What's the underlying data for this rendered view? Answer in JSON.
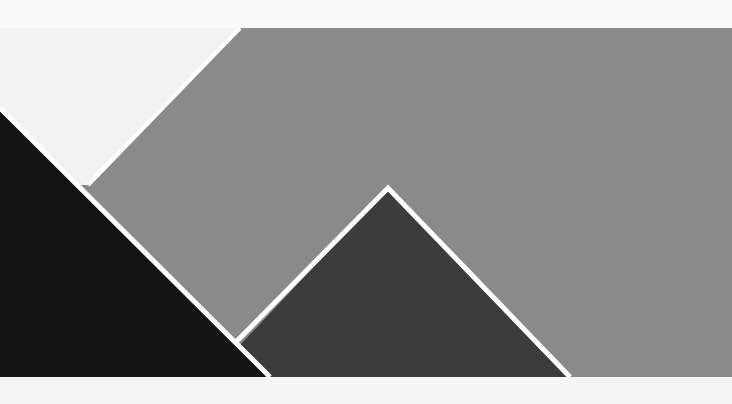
{
  "artwork": {
    "description": "Abstract geometric composition of overlapping triangles on a gray field",
    "colors": {
      "background": "#f7f7f7",
      "paper_white": "#f2f2f2",
      "field_gray": "#8a8a8a",
      "dark_gray": "#3c3c3c",
      "black": "#141414",
      "outline": "#ffffff"
    },
    "shapes": [
      {
        "name": "gray-field",
        "points": "240,28 732,28 732,377 88,377 88,185"
      },
      {
        "name": "white-wedge",
        "points": "0,28 240,28 88,185 0,108"
      },
      {
        "name": "black-triangle",
        "points": "0,108 270,377 0,377"
      },
      {
        "name": "dark-gray-triangle",
        "points": "388,188 570,377 240,377 240,340"
      }
    ]
  }
}
